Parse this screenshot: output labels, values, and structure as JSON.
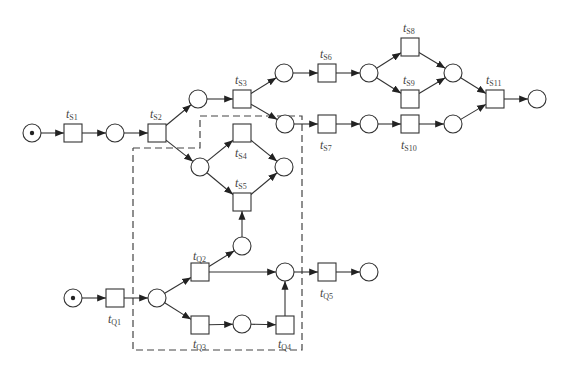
{
  "diagram": {
    "type": "petri-net",
    "colors": {
      "stroke": "#333333",
      "background": "#ffffff",
      "dash": "#444444"
    },
    "places": [
      {
        "id": "pS0",
        "x": 32,
        "y": 133,
        "token": true
      },
      {
        "id": "pS1",
        "x": 115,
        "y": 133,
        "token": false
      },
      {
        "id": "pS2a",
        "x": 198,
        "y": 99,
        "token": false
      },
      {
        "id": "pS2b",
        "x": 200,
        "y": 167,
        "token": false
      },
      {
        "id": "pS3a",
        "x": 284,
        "y": 73,
        "token": false
      },
      {
        "id": "pS3b",
        "x": 285,
        "y": 124,
        "token": false
      },
      {
        "id": "pS45",
        "x": 284,
        "y": 167,
        "token": false
      },
      {
        "id": "pS6",
        "x": 369,
        "y": 73,
        "token": false
      },
      {
        "id": "pS7",
        "x": 369,
        "y": 124,
        "token": false
      },
      {
        "id": "pS89",
        "x": 453,
        "y": 73,
        "token": false
      },
      {
        "id": "pS10",
        "x": 453,
        "y": 124,
        "token": false
      },
      {
        "id": "pS11",
        "x": 537,
        "y": 99,
        "token": false
      },
      {
        "id": "pQ0",
        "x": 73,
        "y": 298,
        "token": true
      },
      {
        "id": "pQ1",
        "x": 157,
        "y": 298,
        "token": false
      },
      {
        "id": "pQ2a",
        "x": 242,
        "y": 246,
        "token": false
      },
      {
        "id": "pQ2b",
        "x": 285,
        "y": 272,
        "token": false
      },
      {
        "id": "pQ3",
        "x": 242,
        "y": 324,
        "token": false
      },
      {
        "id": "pQ5",
        "x": 369,
        "y": 272,
        "token": false
      }
    ],
    "transitions": [
      {
        "id": "tS1",
        "x": 73,
        "y": 133,
        "label": "t",
        "sub": "S1",
        "lx": 66,
        "ly": 118
      },
      {
        "id": "tS2",
        "x": 157,
        "y": 133,
        "label": "t",
        "sub": "S2",
        "lx": 150,
        "ly": 118
      },
      {
        "id": "tS3",
        "x": 242,
        "y": 99,
        "label": "t",
        "sub": "S3",
        "lx": 235,
        "ly": 84
      },
      {
        "id": "tS4",
        "x": 242,
        "y": 133,
        "label": "t",
        "sub": "S4",
        "lx": 235,
        "ly": 157
      },
      {
        "id": "tS5",
        "x": 242,
        "y": 202,
        "label": "t",
        "sub": "S5",
        "lx": 235,
        "ly": 187
      },
      {
        "id": "tS6",
        "x": 327,
        "y": 73,
        "label": "t",
        "sub": "S6",
        "lx": 320,
        "ly": 58
      },
      {
        "id": "tS7",
        "x": 327,
        "y": 124,
        "label": "t",
        "sub": "S7",
        "lx": 320,
        "ly": 149
      },
      {
        "id": "tS8",
        "x": 410,
        "y": 47,
        "label": "t",
        "sub": "S8",
        "lx": 403,
        "ly": 32
      },
      {
        "id": "tS9",
        "x": 410,
        "y": 99,
        "label": "t",
        "sub": "S9",
        "lx": 403,
        "ly": 84
      },
      {
        "id": "tS10",
        "x": 410,
        "y": 124,
        "label": "t",
        "sub": "S10",
        "lx": 401,
        "ly": 149
      },
      {
        "id": "tS11",
        "x": 495,
        "y": 99,
        "label": "t",
        "sub": "S11",
        "lx": 486,
        "ly": 84
      },
      {
        "id": "tQ1",
        "x": 115,
        "y": 298,
        "label": "t",
        "sub": "Q1",
        "lx": 108,
        "ly": 323
      },
      {
        "id": "tQ2",
        "x": 200,
        "y": 272,
        "label": "t",
        "sub": "Q2",
        "lx": 193,
        "ly": 260
      },
      {
        "id": "tQ3",
        "x": 200,
        "y": 325,
        "label": "t",
        "sub": "Q3",
        "lx": 193,
        "ly": 348
      },
      {
        "id": "tQ4",
        "x": 285,
        "y": 325,
        "label": "t",
        "sub": "Q4",
        "lx": 278,
        "ly": 348
      },
      {
        "id": "tQ5",
        "x": 327,
        "y": 272,
        "label": "t",
        "sub": "Q5",
        "lx": 320,
        "ly": 297
      }
    ],
    "arcs": [
      [
        "pS0",
        "tS1"
      ],
      [
        "tS1",
        "pS1"
      ],
      [
        "pS1",
        "tS2"
      ],
      [
        "tS2",
        "pS2a"
      ],
      [
        "tS2",
        "pS2b"
      ],
      [
        "pS2a",
        "tS3"
      ],
      [
        "tS3",
        "pS3a"
      ],
      [
        "tS3",
        "pS3b"
      ],
      [
        "pS2b",
        "tS4"
      ],
      [
        "pS2b",
        "tS5"
      ],
      [
        "tS4",
        "pS45"
      ],
      [
        "tS5",
        "pS45"
      ],
      [
        "pS3a",
        "tS6"
      ],
      [
        "tS6",
        "pS6"
      ],
      [
        "pS6",
        "tS8"
      ],
      [
        "pS6",
        "tS9"
      ],
      [
        "tS8",
        "pS89"
      ],
      [
        "tS9",
        "pS89"
      ],
      [
        "pS3b",
        "tS7"
      ],
      [
        "tS7",
        "pS7"
      ],
      [
        "pS7",
        "tS10"
      ],
      [
        "tS10",
        "pS10"
      ],
      [
        "pS89",
        "tS11"
      ],
      [
        "pS10",
        "tS11"
      ],
      [
        "tS11",
        "pS11"
      ],
      [
        "pQ0",
        "tQ1"
      ],
      [
        "tQ1",
        "pQ1"
      ],
      [
        "pQ1",
        "tQ2"
      ],
      [
        "pQ1",
        "tQ3"
      ],
      [
        "tQ2",
        "pQ2a"
      ],
      [
        "tQ2",
        "pQ2b"
      ],
      [
        "pQ2a",
        "tS5"
      ],
      [
        "tQ3",
        "pQ3"
      ],
      [
        "pQ3",
        "tQ4"
      ],
      [
        "tQ4",
        "pQ2b"
      ],
      [
        "pQ2b",
        "tQ5"
      ],
      [
        "tQ5",
        "pQ5"
      ]
    ],
    "dashed_region": {
      "points": "133,148 200,148 200,116 302,116 302,350 133,350 133,148"
    }
  }
}
